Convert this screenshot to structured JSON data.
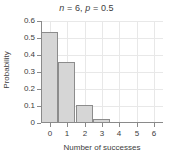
{
  "chart_data": {
    "type": "bar",
    "title": "n = 6, p = 0.5",
    "title_parts": {
      "n_symbol": "n",
      "n_value": " = 6, ",
      "p_symbol": "p",
      "p_value": " = 0.5"
    },
    "xlabel": "Number of successes",
    "ylabel": "Probability",
    "categories": [
      "0",
      "1",
      "2",
      "3",
      "4",
      "5",
      "6"
    ],
    "x": [
      0,
      1,
      2,
      3,
      4,
      5,
      6
    ],
    "values": [
      0.53,
      0.35,
      0.1,
      0.015,
      0,
      0,
      0
    ],
    "xlim": [
      -0.5,
      6.5
    ],
    "ylim": [
      0,
      0.6
    ],
    "xticks": [
      "0",
      "1",
      "2",
      "3",
      "4",
      "5",
      "6"
    ],
    "yticks": [
      "0",
      "0.1",
      "0.2",
      "0.3",
      "0.4",
      "0.5",
      "0.6"
    ],
    "grid": true,
    "legend": null,
    "bar_fill_color": "#d6d6d6",
    "bar_edge_color": "#8c8c8c",
    "grid_color": "#e8e8e8",
    "axis_color": "#8a8a8a",
    "text_color": "#3d3d3d",
    "background_color": "#ffffff"
  }
}
